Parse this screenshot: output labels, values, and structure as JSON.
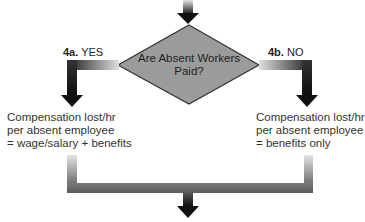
{
  "decision": {
    "question_line1": "Are Absent Workers",
    "question_line2": "Paid?",
    "fill_color": "#9b9b9b",
    "border_color": "#333333"
  },
  "branches": {
    "yes": {
      "step": "4a.",
      "label": "YES",
      "result_lines": [
        "Compensation lost/hr",
        "per absent employee",
        "= wage/salary + benefits"
      ]
    },
    "no": {
      "step": "4b.",
      "label": "NO",
      "result_lines": [
        "Compensation lost/hr",
        "per absent employee",
        "= benefits only"
      ]
    }
  },
  "colors": {
    "arrow_dark": "#111111",
    "arrow_light": "#d8d8d8"
  }
}
